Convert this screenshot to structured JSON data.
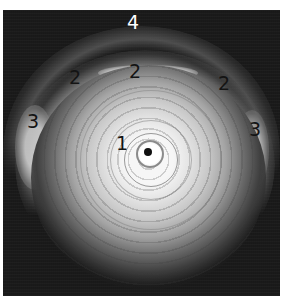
{
  "image": {
    "description": "Grayscale intravascular ultrasound cross-section with numbered annotations",
    "colors": {
      "background": "#1a1a1a",
      "border": "#ffffff",
      "halo_center": "#f6f6f6",
      "catheter_dot": "#111111"
    }
  },
  "labels": {
    "catheter": "1",
    "cap_left": "2",
    "cap_center": "2",
    "cap_right": "2",
    "side_left": "3",
    "side_right": "3",
    "outer": "4"
  }
}
